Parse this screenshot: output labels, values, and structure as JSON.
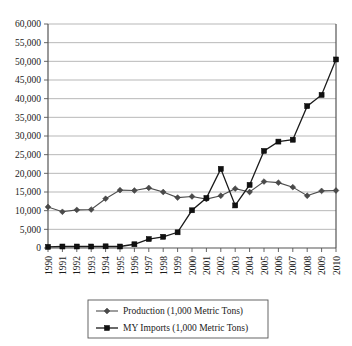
{
  "chart_data": {
    "type": "line",
    "title": "",
    "subtitle": "",
    "xlabel": "",
    "ylabel": "",
    "categories": [
      "1990",
      "1991",
      "1992",
      "1993",
      "1994",
      "1995",
      "1996",
      "1997",
      "1998",
      "1999",
      "2000",
      "2001",
      "2002",
      "2003",
      "2004",
      "2005",
      "2006",
      "2007",
      "2008",
      "2009",
      "2010"
    ],
    "series": [
      {
        "name": "Production (1,000 Metric Tons)",
        "marker": "diamond",
        "color": "#4a4a4a",
        "values": [
          11000,
          9700,
          10200,
          10300,
          13200,
          15500,
          15400,
          16100,
          15000,
          13500,
          13800,
          13100,
          14000,
          15900,
          15000,
          17800,
          17500,
          16300,
          14000,
          15300,
          15400
        ]
      },
      {
        "name": "MY Imports (1,000 Metric Tons)",
        "marker": "square",
        "color": "#111111",
        "values": [
          300,
          400,
          400,
          400,
          450,
          400,
          1000,
          2400,
          3000,
          4200,
          10100,
          13400,
          21200,
          11400,
          16900,
          26000,
          28500,
          29000,
          38000,
          41000,
          50500
        ]
      }
    ],
    "ylim": [
      0,
      60000
    ],
    "ytick_values": [
      0,
      5000,
      10000,
      15000,
      20000,
      25000,
      30000,
      35000,
      40000,
      45000,
      50000,
      55000,
      60000
    ],
    "ytick_labels": [
      "0",
      "5,000",
      "10,000",
      "15,000",
      "20,000",
      "25,000",
      "30,000",
      "35,000",
      "40,000",
      "45,000",
      "50,000",
      "55,000",
      "60,000"
    ],
    "grid": true,
    "legend_position": "bottom",
    "legend_entries": [
      {
        "label": "Production (1,000 Metric Tons)",
        "marker": "diamond"
      },
      {
        "label": "MY Imports (1,000 Metric Tons)",
        "marker": "square"
      }
    ]
  }
}
